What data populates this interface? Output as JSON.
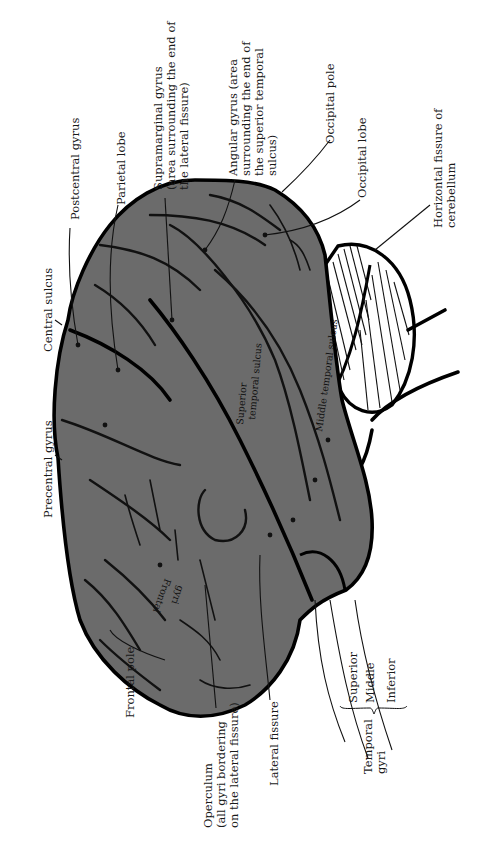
{
  "figure": {
    "colors": {
      "cortex_fill": "#6b6b6b",
      "outline": "#000000",
      "cerebellum_fill": "#ffffff",
      "label_text": "#1a1a1a"
    },
    "labels": {
      "postcentral_gyrus": "Postcentral gyrus",
      "parietal_lobe": "Parietal lobe",
      "supramarginal_1": "Supramarginal gyrus",
      "supramarginal_2": "(area surrounding the end of",
      "supramarginal_3": "the lateral fissure)",
      "angular_1": "Angular gyrus (area",
      "angular_2": "surrounding the end of",
      "angular_3": "the superior temporal",
      "angular_4": "sulcus)",
      "occipital_pole": "Occipital pole",
      "occipital_lobe": "Occipital lobe",
      "horizontal_fissure_1": "Horizontal fissure of",
      "horizontal_fissure_2": "cerebellum",
      "central_sulcus": "Central sulcus",
      "precentral_gyrus": "Precentral gyrus",
      "frontal_pole": "Frontal pole",
      "operculum_1": "Operculum",
      "operculum_2": "(all gyri bordering",
      "operculum_3": "on the lateral fissure)",
      "lateral_fissure": "Lateral fissure",
      "temporal_superior": "Superior",
      "temporal_middle": "Middle",
      "temporal_inferior": "Inferior",
      "temporal_gyri_1": "Temporal",
      "temporal_gyri_2": "gyri"
    },
    "inner_labels": {
      "frontal_gyri_1": "Frontal",
      "frontal_gyri_2": "gyri",
      "superior_temporal_sulcus_1": "Superior",
      "superior_temporal_sulcus_2": "temporal sulcus",
      "middle_temporal_sulcus": "Middle temporal sulcus"
    }
  }
}
